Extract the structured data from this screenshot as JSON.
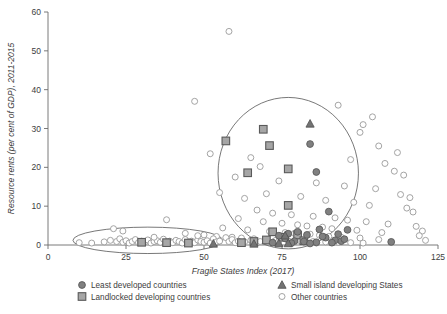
{
  "chart_data": {
    "type": "scatter",
    "title": "",
    "xlabel": "Fragile States Index (2017)",
    "ylabel": "Resource rents (per cent of GDP), 2011-2015",
    "xlim": [
      0,
      125
    ],
    "ylim": [
      0,
      60
    ],
    "xticks": [
      0,
      25,
      50,
      75,
      100,
      125
    ],
    "yticks": [
      0,
      10,
      20,
      30,
      40,
      50,
      60
    ],
    "grid": false,
    "legend_position": "bottom",
    "legend": [
      {
        "label": "Least developed countries",
        "marker": "circle-filled",
        "color": "#808080"
      },
      {
        "label": "Landlocked developing countries",
        "marker": "square-filled",
        "color": "#a6a6a6"
      },
      {
        "label": "Small island developing States",
        "marker": "triangle-filled",
        "color": "#737373"
      },
      {
        "label": "Other countries",
        "marker": "circle-open",
        "color": "#ffffff"
      }
    ],
    "annotations": [
      {
        "type": "ellipse",
        "name": "low-fragility-low-rents-ellipse",
        "cx": 32,
        "cy": 1.2,
        "rx": 24,
        "ry": 3.4
      },
      {
        "type": "ellipse",
        "name": "high-fragility-cluster-circle",
        "cx": 77,
        "cy": 18.5,
        "rx": 22.5,
        "ry": 19.5
      }
    ],
    "series": [
      {
        "name": "Least developed countries",
        "marker": "circle-filled",
        "points": [
          [
            86,
            18.8
          ],
          [
            84,
            26.0
          ],
          [
            90,
            8.6
          ],
          [
            96,
            3.9
          ],
          [
            89,
            1.9
          ],
          [
            92,
            1.2
          ],
          [
            94,
            1.0
          ],
          [
            110,
            0.8
          ],
          [
            83,
            2.6
          ],
          [
            80,
            3.4
          ],
          [
            77,
            2.9
          ],
          [
            74,
            2.4
          ],
          [
            88,
            2.2
          ],
          [
            91,
            0.6
          ],
          [
            79,
            1.0
          ],
          [
            82,
            0.9
          ],
          [
            86,
            0.7
          ],
          [
            76,
            1.7
          ],
          [
            95,
            1.5
          ],
          [
            93,
            2.8
          ],
          [
            87,
            4.0
          ],
          [
            78,
            0.5
          ],
          [
            72,
            0.6
          ],
          [
            84,
            0.4
          ]
        ]
      },
      {
        "name": "Landlocked developing countries",
        "marker": "square-filled",
        "points": [
          [
            57,
            26.8
          ],
          [
            69,
            29.8
          ],
          [
            71,
            25.6
          ],
          [
            64,
            18.6
          ],
          [
            77,
            19.6
          ],
          [
            77,
            10.2
          ],
          [
            80,
            2.6
          ],
          [
            72,
            3.4
          ],
          [
            75,
            2.0
          ],
          [
            70,
            1.3
          ],
          [
            66,
            0.9
          ],
          [
            82,
            1.1
          ],
          [
            62,
            0.6
          ],
          [
            45,
            0.5
          ],
          [
            38,
            0.6
          ],
          [
            30,
            0.7
          ]
        ]
      },
      {
        "name": "Small island developing States",
        "marker": "triangle-filled",
        "points": [
          [
            84,
            31.2
          ],
          [
            76,
            2.4
          ],
          [
            74,
            0.4
          ],
          [
            77,
            0.4
          ],
          [
            66,
            0.3
          ],
          [
            53,
            0.3
          ]
        ]
      },
      {
        "name": "Other countries",
        "marker": "circle-open",
        "points": [
          [
            58,
            55.0
          ],
          [
            47,
            37.0
          ],
          [
            93,
            36.0
          ],
          [
            104,
            33.0
          ],
          [
            101,
            31.0
          ],
          [
            100,
            29.0
          ],
          [
            106,
            25.5
          ],
          [
            112,
            23.8
          ],
          [
            52,
            23.5
          ],
          [
            65,
            22.5
          ],
          [
            97,
            22.0
          ],
          [
            108,
            21.0
          ],
          [
            111,
            19.0
          ],
          [
            114,
            18.0
          ],
          [
            68,
            20.2
          ],
          [
            60,
            17.5
          ],
          [
            74,
            16.5
          ],
          [
            86,
            16.0
          ],
          [
            95,
            15.2
          ],
          [
            105,
            14.5
          ],
          [
            113,
            13.0
          ],
          [
            116,
            12.2
          ],
          [
            55,
            13.5
          ],
          [
            63,
            12.0
          ],
          [
            70,
            13.2
          ],
          [
            81,
            12.5
          ],
          [
            89,
            11.5
          ],
          [
            98,
            11.0
          ],
          [
            103,
            10.2
          ],
          [
            115,
            9.5
          ],
          [
            117,
            8.5
          ],
          [
            67,
            9.0
          ],
          [
            72,
            8.2
          ],
          [
            78,
            7.8
          ],
          [
            85,
            7.4
          ],
          [
            92,
            7.0
          ],
          [
            96,
            6.4
          ],
          [
            102,
            6.0
          ],
          [
            109,
            5.4
          ],
          [
            118,
            4.8
          ],
          [
            120,
            3.6
          ],
          [
            61,
            6.8
          ],
          [
            69,
            6.0
          ],
          [
            75,
            5.6
          ],
          [
            80,
            5.2
          ],
          [
            83,
            4.9
          ],
          [
            88,
            4.6
          ],
          [
            91,
            4.2
          ],
          [
            99,
            3.8
          ],
          [
            107,
            3.2
          ],
          [
            119,
            2.4
          ],
          [
            56,
            4.4
          ],
          [
            64,
            3.9
          ],
          [
            71,
            3.5
          ],
          [
            76,
            3.2
          ],
          [
            79,
            3.0
          ],
          [
            84,
            2.8
          ],
          [
            87,
            2.5
          ],
          [
            90,
            2.2
          ],
          [
            94,
            2.0
          ],
          [
            100,
            1.8
          ],
          [
            106,
            1.4
          ],
          [
            121,
            1.2
          ],
          [
            50,
            2.6
          ],
          [
            54,
            2.2
          ],
          [
            59,
            2.0
          ],
          [
            62,
            1.8
          ],
          [
            66,
            1.6
          ],
          [
            70,
            1.4
          ],
          [
            73,
            1.2
          ],
          [
            77,
            1.1
          ],
          [
            81,
            1.0
          ],
          [
            85,
            0.9
          ],
          [
            89,
            0.8
          ],
          [
            93,
            0.7
          ],
          [
            97,
            0.6
          ],
          [
            101,
            0.5
          ],
          [
            10,
            0.6
          ],
          [
            14,
            0.5
          ],
          [
            18,
            0.8
          ],
          [
            20,
            1.2
          ],
          [
            22,
            0.9
          ],
          [
            23,
            1.6
          ],
          [
            24,
            0.7
          ],
          [
            25,
            1.1
          ],
          [
            26,
            0.5
          ],
          [
            27,
            0.9
          ],
          [
            28,
            1.4
          ],
          [
            29,
            0.6
          ],
          [
            30,
            1.0
          ],
          [
            31,
            0.8
          ],
          [
            32,
            1.3
          ],
          [
            33,
            0.5
          ],
          [
            34,
            0.9
          ],
          [
            35,
            1.1
          ],
          [
            36,
            0.7
          ],
          [
            37,
            1.5
          ],
          [
            38,
            0.8
          ],
          [
            39,
            1.0
          ],
          [
            40,
            0.6
          ],
          [
            41,
            1.2
          ],
          [
            42,
            0.9
          ],
          [
            43,
            0.5
          ],
          [
            44,
            1.4
          ],
          [
            45,
            0.8
          ],
          [
            46,
            1.0
          ],
          [
            47,
            0.6
          ],
          [
            48,
            1.3
          ],
          [
            49,
            0.9
          ],
          [
            50,
            0.7
          ],
          [
            51,
            1.1
          ],
          [
            52,
            0.5
          ],
          [
            53,
            1.6
          ],
          [
            54,
            0.8
          ],
          [
            55,
            1.0
          ],
          [
            21,
            4.2
          ],
          [
            24,
            3.6
          ],
          [
            44,
            3.0
          ],
          [
            48,
            2.4
          ],
          [
            57,
            1.9
          ],
          [
            58,
            0.9
          ],
          [
            59,
            1.4
          ],
          [
            60,
            0.6
          ],
          [
            61,
            1.0
          ],
          [
            63,
            0.8
          ],
          [
            65,
            1.2
          ],
          [
            67,
            0.5
          ],
          [
            68,
            0.9
          ],
          [
            72,
            0.7
          ],
          [
            74,
            1.0
          ],
          [
            78,
            0.6
          ],
          [
            82,
            0.8
          ],
          [
            86,
            0.5
          ],
          [
            38,
            6.5
          ],
          [
            34,
            2.0
          ]
        ]
      }
    ]
  }
}
